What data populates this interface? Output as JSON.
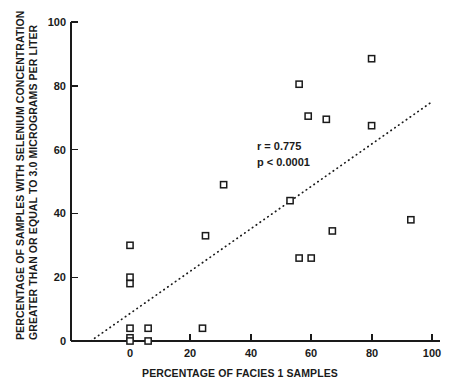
{
  "chart_data": {
    "type": "scatter",
    "title": "",
    "xlabel": "PERCENTAGE OF FACIES 1 SAMPLES",
    "ylabel": "PERCENTAGE OF SAMPLES WITH SELENIUM CONCENTRATION GREATER THAN OR EQUAL TO 3.0 MICROGRAMS PER LITER",
    "ylabel_line1": "PERCENTAGE OF SAMPLES WITH SELENIUM CONCENTRATION",
    "ylabel_line2": "GREATER THAN OR EQUAL TO 3.0 MICROGRAMS PER LITER",
    "xlim": [
      -13,
      100
    ],
    "ylim": [
      0,
      100
    ],
    "xticks": [
      0,
      20,
      40,
      60,
      80,
      100
    ],
    "xtick_labels": [
      "0",
      "20",
      "40",
      "60",
      "80",
      "100"
    ],
    "yticks": [
      0,
      20,
      40,
      60,
      80,
      100
    ],
    "ytick_labels": [
      "0",
      "20",
      "40",
      "60",
      "80",
      "100"
    ],
    "grid": false,
    "legend": null,
    "marker_style": "open-square",
    "marker_color": "#1a1a1a",
    "points": [
      {
        "x": 0,
        "y": 30
      },
      {
        "x": 0,
        "y": 20
      },
      {
        "x": 0,
        "y": 18
      },
      {
        "x": 0,
        "y": 4
      },
      {
        "x": 0,
        "y": 1
      },
      {
        "x": 0,
        "y": 0
      },
      {
        "x": 6,
        "y": 4
      },
      {
        "x": 6,
        "y": 0
      },
      {
        "x": 24,
        "y": 4
      },
      {
        "x": 25,
        "y": 33
      },
      {
        "x": 31,
        "y": 49
      },
      {
        "x": 53,
        "y": 44
      },
      {
        "x": 56,
        "y": 80.5
      },
      {
        "x": 56,
        "y": 26
      },
      {
        "x": 59,
        "y": 70.5
      },
      {
        "x": 60,
        "y": 26
      },
      {
        "x": 65,
        "y": 69.5
      },
      {
        "x": 67,
        "y": 34.5
      },
      {
        "x": 80,
        "y": 88.5
      },
      {
        "x": 80,
        "y": 67.5
      },
      {
        "x": 93,
        "y": 38
      }
    ],
    "trend_line": {
      "style": "dotted",
      "x_start": -13,
      "y_start": 0,
      "x_end": 100,
      "y_end": 75
    },
    "annotations": [
      {
        "text": "r = 0.775",
        "x": 40,
        "y": 60
      },
      {
        "text": "p < 0.0001",
        "x": 40,
        "y": 55
      }
    ],
    "statistics": {
      "r": "r = 0.775",
      "p": "p < 0.0001"
    }
  }
}
